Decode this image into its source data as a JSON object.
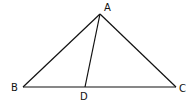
{
  "diagram": {
    "points": {
      "A": {
        "label": "A",
        "x": 100,
        "y": 14
      },
      "B": {
        "label": "B",
        "x": 23,
        "y": 87
      },
      "C": {
        "label": "C",
        "x": 176,
        "y": 87
      },
      "D": {
        "label": "D",
        "x": 85,
        "y": 87
      }
    },
    "segments": [
      "AB",
      "AC",
      "BC",
      "AD"
    ],
    "stroke_color": "#111111"
  }
}
